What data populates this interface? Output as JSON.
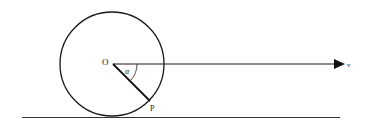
{
  "diagram": {
    "labels": {
      "center": "O",
      "point": "P",
      "angle": "α",
      "velocity": "v"
    },
    "colors": {
      "stroke": "#1a1a1a",
      "background": "#ffffff"
    }
  }
}
